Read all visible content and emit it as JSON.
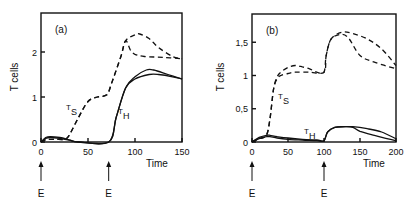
{
  "chart_data": [
    {
      "type": "line",
      "panel_label": "(a)",
      "xlabel": "Time",
      "ylabel": "T cells",
      "xlim": [
        0,
        150
      ],
      "ylim": [
        0,
        2.6
      ],
      "xticks": [
        "0",
        "50",
        "100",
        "150"
      ],
      "yticks": [
        "0",
        "1",
        "2"
      ],
      "annotations": [
        {
          "text": "E",
          "x": 0,
          "type": "arrow"
        },
        {
          "text": "E",
          "x": 72,
          "type": "arrow"
        },
        {
          "text": "T_S",
          "near": "dashed curves"
        },
        {
          "text": "T_H",
          "near": "solid curves"
        }
      ],
      "series": [
        {
          "name": "T_S (1)",
          "style": "dashed",
          "x": [
            0,
            5,
            15,
            25,
            30,
            40,
            50,
            60,
            70,
            75,
            85,
            90,
            100,
            105,
            115,
            125,
            140,
            150
          ],
          "values": [
            0,
            0.05,
            0.06,
            0.06,
            0.15,
            0.55,
            0.9,
            1.0,
            1.05,
            1.3,
            1.9,
            2.25,
            2.38,
            2.4,
            2.3,
            2.1,
            1.9,
            1.85
          ]
        },
        {
          "name": "T_S (2)",
          "style": "dashed",
          "x": [
            0,
            5,
            15,
            25,
            30,
            40,
            50,
            60,
            70,
            75,
            85,
            90,
            95,
            100,
            110,
            130,
            150
          ],
          "values": [
            0,
            0.05,
            0.06,
            0.06,
            0.15,
            0.55,
            0.9,
            1.0,
            1.05,
            1.3,
            1.9,
            2.25,
            2.05,
            1.95,
            1.9,
            1.88,
            1.85
          ]
        },
        {
          "name": "T_H (1)",
          "style": "solid",
          "x": [
            0,
            5,
            10,
            20,
            30,
            40,
            72,
            80,
            90,
            100,
            112,
            120,
            135,
            150
          ],
          "values": [
            0,
            0.1,
            0.12,
            0.1,
            0.05,
            0,
            0,
            0.55,
            1.2,
            1.45,
            1.6,
            1.6,
            1.5,
            1.4
          ]
        },
        {
          "name": "T_H (2)",
          "style": "solid",
          "x": [
            0,
            5,
            10,
            20,
            30,
            40,
            72,
            80,
            90,
            100,
            115,
            125,
            140,
            150
          ],
          "values": [
            0,
            0.08,
            0.1,
            0.08,
            0.04,
            0,
            0,
            0.55,
            1.2,
            1.4,
            1.5,
            1.5,
            1.45,
            1.4
          ]
        }
      ]
    },
    {
      "type": "line",
      "panel_label": "(b)",
      "xlabel": "Time",
      "ylabel": "T cells",
      "xlim": [
        0,
        200
      ],
      "ylim": [
        0,
        1.9
      ],
      "xticks": [
        "0",
        "50",
        "100",
        "150",
        "200"
      ],
      "yticks": [
        "0",
        "0,5",
        "1",
        "1,5"
      ],
      "annotations": [
        {
          "text": "E",
          "x": 0,
          "type": "arrow"
        },
        {
          "text": "E",
          "x": 100,
          "type": "arrow"
        },
        {
          "text": "T_S",
          "near": "dashed curves"
        },
        {
          "text": "T_H",
          "near": "solid curves"
        }
      ],
      "series": [
        {
          "name": "T_S (1)",
          "style": "dashed",
          "x": [
            0,
            10,
            20,
            25,
            30,
            35,
            40,
            50,
            60,
            70,
            80,
            90,
            100,
            103,
            110,
            125,
            140,
            160,
            180,
            200
          ],
          "values": [
            0,
            0.05,
            0.1,
            0.35,
            0.8,
            0.98,
            1.05,
            1.12,
            1.15,
            1.13,
            1.1,
            1.05,
            1.05,
            1.3,
            1.55,
            1.65,
            1.63,
            1.55,
            1.4,
            1.15
          ]
        },
        {
          "name": "T_S (2)",
          "style": "dashed",
          "x": [
            0,
            10,
            20,
            25,
            30,
            35,
            40,
            50,
            60,
            80,
            100,
            103,
            110,
            125,
            135,
            150,
            170,
            200
          ],
          "values": [
            0,
            0.05,
            0.1,
            0.35,
            0.8,
            0.95,
            1.0,
            1.03,
            1.05,
            1.05,
            1.05,
            1.3,
            1.55,
            1.62,
            1.55,
            1.3,
            1.2,
            1.1
          ]
        },
        {
          "name": "T_H (1)",
          "style": "solid",
          "x": [
            0,
            10,
            20,
            25,
            35,
            50,
            70,
            90,
            100,
            105,
            115,
            130,
            140,
            160,
            180,
            200
          ],
          "values": [
            0,
            0.07,
            0.1,
            0.1,
            0.08,
            0.06,
            0.04,
            0.03,
            0.02,
            0.15,
            0.22,
            0.23,
            0.23,
            0.2,
            0.15,
            0.05
          ]
        },
        {
          "name": "T_H (2)",
          "style": "solid",
          "x": [
            0,
            10,
            20,
            25,
            35,
            50,
            70,
            90,
            100,
            105,
            115,
            130,
            140,
            150,
            170,
            200
          ],
          "values": [
            0,
            0.05,
            0.08,
            0.08,
            0.06,
            0.04,
            0.03,
            0.02,
            0.02,
            0.15,
            0.22,
            0.23,
            0.22,
            0.16,
            0.1,
            0.02
          ]
        }
      ]
    }
  ]
}
